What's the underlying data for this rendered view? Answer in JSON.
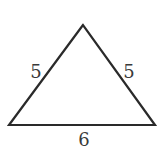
{
  "diagram": {
    "type": "isosceles-triangle",
    "vertices": {
      "apex": [
        83,
        25
      ],
      "bottom_left": [
        9,
        125
      ],
      "bottom_right": [
        155,
        125
      ]
    },
    "stroke_color": "#2a2a2a",
    "labels": {
      "left_side": "5",
      "right_side": "5",
      "base": "6"
    }
  }
}
